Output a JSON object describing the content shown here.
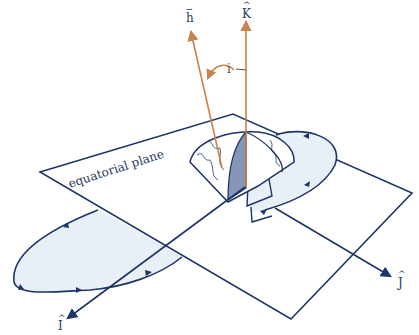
{
  "figure": {
    "type": "orbital-geometry"
  },
  "labels": {
    "plane": "equatorial plane",
    "h_vector": "h",
    "h_vector_accent": "⇀",
    "k_axis": "K",
    "k_hat": "^",
    "i_axis": "I",
    "i_hat": "^",
    "j_axis": "J",
    "j_hat": "^",
    "inclination": "i"
  },
  "colors": {
    "line": "#1f3566",
    "orbit_fill": "#e8eff7",
    "vector": "#c9824a",
    "globe_shade": "#8796b8",
    "text": "#2a3a60"
  }
}
